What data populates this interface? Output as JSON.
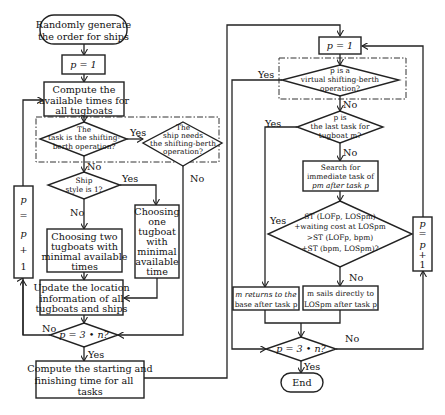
{
  "diagram": {
    "type": "flowchart",
    "left": {
      "start": [
        "Randomly generate",
        "the order for ships"
      ],
      "init": "p = 1",
      "compute_avail": [
        "Compute the",
        "available times for",
        "all tugboats"
      ],
      "d_shifting": [
        "The",
        "task is the shifting-",
        "berth operation?"
      ],
      "d_ship_needs": [
        "The",
        "ship needs",
        "the shifting-berth",
        "operation?"
      ],
      "d_style": [
        "Ship",
        "style is 1?"
      ],
      "choose_two": [
        "Choosing two",
        "tugboats with",
        "minimal available",
        "times"
      ],
      "choose_one": [
        "Choosing",
        "one",
        "tugboat",
        "with",
        "minimal",
        "available",
        "time"
      ],
      "update": [
        "Update the location",
        "information of all",
        "tugboats and ships"
      ],
      "d_end": "p = 3 • n?",
      "compute_times": [
        "Compute the starting and",
        "finishing time for all",
        "tasks"
      ],
      "increment": [
        "p",
        "=",
        "p",
        "+",
        "1"
      ]
    },
    "right": {
      "init": "p = 1",
      "d_virtual": [
        "p is a",
        "virtual shifting-berth",
        "operation?"
      ],
      "d_last": [
        "p is",
        "the last task for",
        "tugboat m?"
      ],
      "search": [
        "Search for",
        "immediate task of",
        "pm after task p"
      ],
      "d_cost": [
        "ST (LOFp, LOSpm)",
        "+waiting cost at LOSpm",
        ">ST (LOFp, bpm)",
        "+ST (bpm, LOSpm)?"
      ],
      "returns": [
        "m returns to the",
        "base after task p"
      ],
      "sails": [
        "m sails directly to",
        "LOSpm after task p"
      ],
      "d_end": "p = 3 • n?",
      "end": "End",
      "increment": [
        "p",
        "=",
        "p",
        "+",
        "1"
      ]
    },
    "labels": {
      "yes": "Yes",
      "no": "No"
    }
  }
}
